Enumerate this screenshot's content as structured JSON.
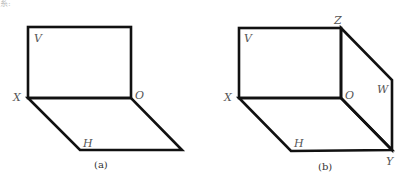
{
  "stray_text": "系:",
  "figure_a": {
    "caption": "(a)",
    "labels": {
      "V": "V",
      "X": "X",
      "O": "O",
      "H": "H"
    }
  },
  "figure_b": {
    "caption": "(b)",
    "labels": {
      "V": "V",
      "X": "X",
      "O": "O",
      "H": "H",
      "Z": "Z",
      "W": "W",
      "Y": "Y"
    }
  }
}
